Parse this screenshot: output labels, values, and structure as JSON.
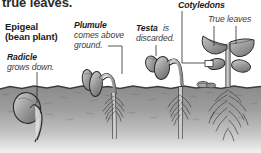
{
  "figure": {
    "name": "epigeal-germination-diagram",
    "cut_title": "true leaves.",
    "colors": {
      "soil": "#8d8d8d",
      "soil_light": "#b5b5b5",
      "plant": "#9a9a9a",
      "outline": "#2a2a2a",
      "text": "#1a1a1a",
      "background": "#ffffff"
    }
  },
  "labels": {
    "epigeal_title": "Epigeal",
    "epigeal_subtitle": "(bean plant)",
    "radicle_term": "Radicle",
    "radicle_desc": "grows down.",
    "plumule_term": "Plumule",
    "plumule_desc_line1": "comes above",
    "plumule_desc_line2": "ground.",
    "testa_term": "Testa",
    "testa_desc_line1": "is",
    "testa_desc_line2": "discarded.",
    "cotyledons_term": "Cotyledons",
    "true_leaves_term": "True leaves"
  },
  "stages": [
    {
      "index": 1,
      "name": "stage-seed-underground",
      "description": "Seed below soil with radicle growing down",
      "callout": "Radicle"
    },
    {
      "index": 2,
      "name": "stage-hypocotyl-arch",
      "description": "Hypocotyl arch pulls cotyledons above ground",
      "callout": "Plumule"
    },
    {
      "index": 3,
      "name": "stage-testa-shed",
      "description": "Seed coat discarded as shoot straightens",
      "callout": "Testa"
    },
    {
      "index": 4,
      "name": "stage-true-leaves",
      "description": "Seedling with expanded cotyledons and first true leaves",
      "callout": "Cotyledons / True leaves"
    }
  ]
}
